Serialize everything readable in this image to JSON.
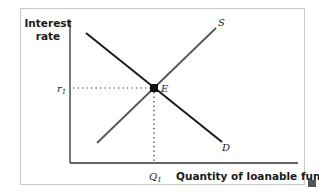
{
  "diagram": {
    "y_axis_label_line1": "Interest",
    "y_axis_label_line2": "rate",
    "x_axis_label": "Quantity of loanable funds",
    "supply_label": "S",
    "demand_label": "D",
    "equilibrium_label": "E",
    "rate_label": "r",
    "rate_subscript": "1",
    "quantity_label": "Q",
    "quantity_subscript": "1",
    "colors": {
      "supply_line": "#555555",
      "demand_line": "#1a1a1a",
      "axis": "#333333",
      "frame_border": "#c8c8c8"
    }
  }
}
